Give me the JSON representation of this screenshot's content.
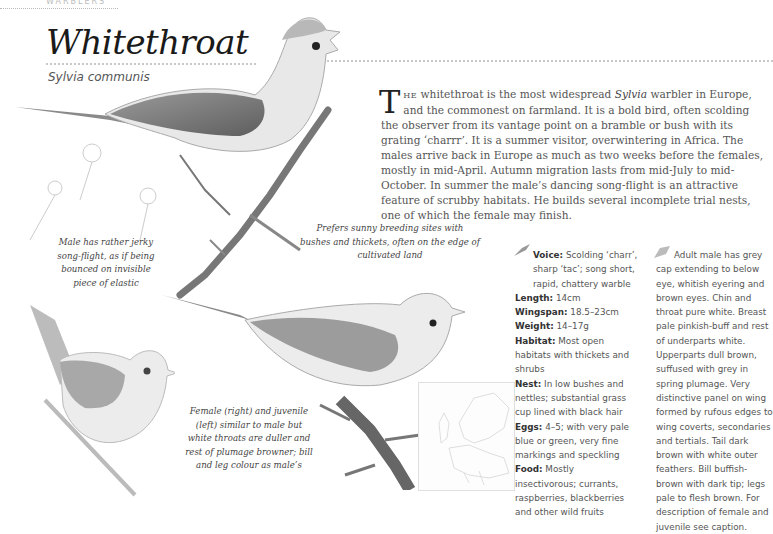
{
  "header": {
    "section_label": "WARBLERS",
    "title": "Whitethroat",
    "latin_name": "Sylvia communis"
  },
  "intro": {
    "dropcap": "T",
    "smallcaps": "HE",
    "text_before_italic": " whitethroat is the most widespread ",
    "italic": "Sylvia",
    "text_after_italic": " warbler in Europe, and the commonest on farmland. It is a bold bird, often scolding the observer from its vantage point on a bramble or bush with its grating ‘charrr’. It is a summer visitor, overwintering in Africa. The males arrive back in Europe as much as two weeks before the females, mostly in mid-April. Autumn migration lasts from mid-July to mid-October. In summer the male’s dancing song-flight is an attractive feature of scrubby habitats. He builds several incomplete trial nests, one of which the female may finish."
  },
  "captions": {
    "song_flight": "Male has rather jerky song-flight, as if being bounced on invisible piece of elastic",
    "habitat": "Prefers sunny breeding sites with bushes and thickets, often on the edge of cultivated land",
    "female_juvenile": "Female (right) and juvenile (left) similar to male but white throats are duller and rest of plumage browner; bill and leg colour as male’s"
  },
  "facts": [
    {
      "label": "Voice:",
      "value": " Scolding ‘charr’, sharp ‘tac’; song short, rapid, chattery warble"
    },
    {
      "label": "Length:",
      "value": " 14cm"
    },
    {
      "label": "Wingspan:",
      "value": " 18.5–23cm"
    },
    {
      "label": "Weight:",
      "value": " 14–17g"
    },
    {
      "label": "Habitat:",
      "value": " Most open habitats with thickets and shrubs"
    },
    {
      "label": "Nest:",
      "value": " In low bushes and nettles; substantial grass cup lined with black hair"
    },
    {
      "label": "Eggs:",
      "value": " 4–5; with very pale blue or green, very fine markings and speckling"
    },
    {
      "label": "Food:",
      "value": " Mostly insectivorous; currants, raspberries, blackberries and other wild fruits"
    }
  ],
  "description": "Adult male has grey cap extending to below eye, whitish eyering and brown eyes. Chin and throat pure white. Breast pale pinkish-buff and rest of underparts white. Upperparts dull brown, suffused with grey in spring plumage. Very distinctive panel on wing formed by rufous edges to wing coverts, secondaries and tertials. Tail dark brown with white outer feathers. Bill buffish-brown with dark tip; legs pale to flesh brown. For description of female and juvenile see caption.",
  "icons": {
    "voice": "bird-song-icon",
    "plumage": "feather-icon",
    "map": "distribution-map"
  }
}
